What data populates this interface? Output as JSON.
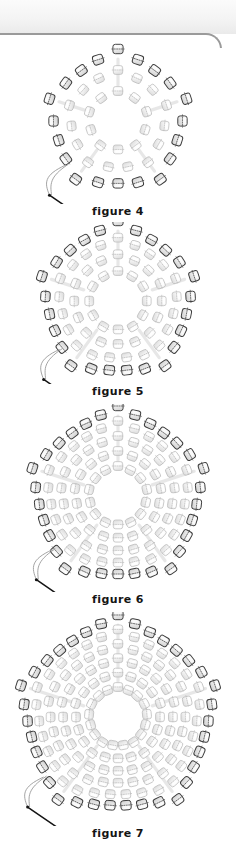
{
  "page": {
    "background_color": "#ffffff",
    "chrome_strip_color": "#f2f2f2",
    "chrome_border_color": "#9a9a9a"
  },
  "diagram_data": {
    "type": "beading-instruction-diagram",
    "subject": "pentagonal peyote stitch bead ring progression",
    "bead_colors": {
      "outline_dark": "#3a3a3a",
      "outline_light": "#b8b8b8",
      "fill_light": "#f2f2f2",
      "fill_mid": "#d8d8d8",
      "highlight": "#ffffff",
      "thread": "#9a9a9a",
      "needle": "#141414"
    },
    "figures": [
      {
        "id": "figure-4",
        "caption": "figure 4",
        "sides": 5,
        "rings": 3,
        "outer_radius": 72,
        "inner_radius": 30,
        "outer_bead_count": 20,
        "has_needle": true,
        "needle_position": "lower-left"
      },
      {
        "id": "figure-5",
        "caption": "figure 5",
        "sides": 5,
        "rings": 4,
        "outer_radius": 80,
        "inner_radius": 30,
        "outer_bead_count": 25,
        "has_needle": true,
        "needle_position": "lower-left"
      },
      {
        "id": "figure-6",
        "caption": "figure 6",
        "sides": 5,
        "rings": 5,
        "outer_radius": 90,
        "inner_radius": 30,
        "outer_bead_count": 30,
        "has_needle": true,
        "needle_position": "lower-left"
      },
      {
        "id": "figure-7",
        "caption": "figure 7",
        "sides": 5,
        "rings": 6,
        "outer_radius": 102,
        "inner_radius": 30,
        "outer_bead_count": 35,
        "has_needle": true,
        "needle_position": "lower-left"
      }
    ]
  }
}
